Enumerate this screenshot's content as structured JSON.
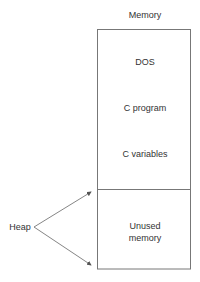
{
  "title": "Memory",
  "segments": [
    {
      "label": "DOS"
    },
    {
      "label": "C program"
    },
    {
      "label": "C variables"
    },
    {
      "label": "Unused memory",
      "line1": "Unused",
      "line2": "memory"
    }
  ],
  "pointer": {
    "label": "Heap"
  },
  "colors": {
    "line": "#666666",
    "text": "#333333"
  }
}
